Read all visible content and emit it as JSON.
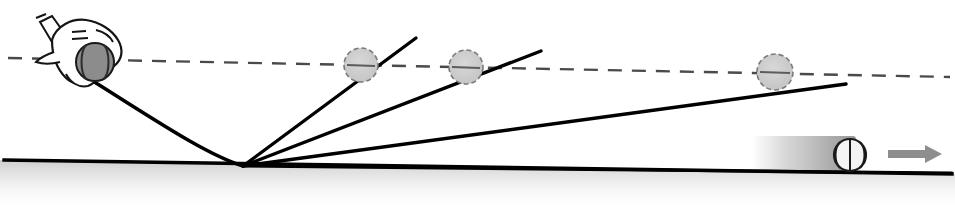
{
  "figure": {
    "kind": "physics-illustration",
    "width": 955,
    "height": 210,
    "background_color": "#ffffff"
  },
  "colors": {
    "ink": "#111111",
    "line": "#000000",
    "ghost_fill": "#c9c9c9",
    "ghost_stroke": "#6e6e6e",
    "ball_fill": "#8c8c8c",
    "ball_stroke": "#1a1a1a",
    "arrow_fill": "#8e8e8e",
    "blur_color": "#9a9a9a",
    "ground_shadow": "#cccccc",
    "hand_fill": "#ffffff",
    "hand_stroke": "#141414"
  },
  "reference_line": {
    "label": "horizontal-reference-dashed-line",
    "x1": 8,
    "y1": 58,
    "x2": 950,
    "y2": 77,
    "dash": "14 10",
    "width": 2.4
  },
  "ground": {
    "label": "ground-surface-line",
    "x1": 4,
    "y1": 160,
    "x2": 952,
    "y2": 174,
    "width": 3.4,
    "shadow_height": 44
  },
  "hand": {
    "label": "throwing-hand",
    "x": 22,
    "y": 12,
    "cuff_label": "sleeve-cuff",
    "knuckle_marks": 3
  },
  "held_ball": {
    "label": "held-ball",
    "cx": 95,
    "cy": 62,
    "r": 19,
    "seams": 2
  },
  "incoming_path": {
    "label": "incoming-throw-trajectory",
    "start_x": 88,
    "start_y": 78,
    "bounce_x": 243,
    "bounce_y": 166,
    "width": 3.6
  },
  "bounce_point": {
    "label": "bounce-contact-point",
    "x": 243,
    "y": 166
  },
  "rebound_paths": [
    {
      "id": "rebound-steep",
      "angle_name": "steepest",
      "x1": 243,
      "y1": 166,
      "x2": 416,
      "y2": 38,
      "width": 3.4
    },
    {
      "id": "rebound-medium",
      "angle_name": "medium",
      "x1": 243,
      "y1": 166,
      "x2": 541,
      "y2": 51,
      "width": 3.4
    },
    {
      "id": "rebound-shallow",
      "angle_name": "shallow",
      "x1": 243,
      "y1": 166,
      "x2": 846,
      "y2": 84,
      "width": 3.4
    },
    {
      "id": "rebound-grazing",
      "angle_name": "grazing",
      "x1": 243,
      "y1": 166,
      "x2": 952,
      "y2": 173,
      "width": 3.0
    }
  ],
  "ghost_balls": [
    {
      "id": "ghost-ball-1",
      "cx": 361,
      "cy": 65,
      "r": 17
    },
    {
      "id": "ghost-ball-2",
      "cx": 466,
      "cy": 67,
      "r": 17
    },
    {
      "id": "ghost-ball-3",
      "cx": 775,
      "cy": 72,
      "r": 18
    }
  ],
  "rolling_ball": {
    "label": "rolling-ball",
    "cx": 850,
    "cy": 155,
    "r": 16,
    "seams": 2
  },
  "motion_blur": {
    "label": "motion-blur-trail",
    "x": 752,
    "y": 136,
    "width": 104,
    "height": 38
  },
  "direction_arrow": {
    "label": "direction-arrow-right",
    "x": 888,
    "y": 148,
    "length": 52,
    "thickness": 9,
    "head_size": 15,
    "points": "right"
  }
}
